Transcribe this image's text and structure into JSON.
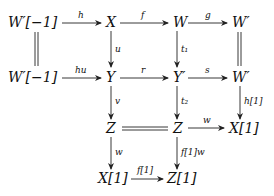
{
  "diagram": {
    "type": "commutative-diagram",
    "nodes": {
      "r1c0": "W′[−1]",
      "r1c1": "X",
      "r1c2": "W",
      "r1c3": "W′",
      "r2c0": "W′[−1]",
      "r2c1": "Y",
      "r2c2": "Y′",
      "r2c3": "W′",
      "r3c1": "Z",
      "r3c2": "Z",
      "r3c3": "X[1]",
      "r4c1": "X[1]",
      "r4c2": "Z[1]"
    },
    "arrows": {
      "h": "h",
      "f": "f",
      "g": "g",
      "hu": "hu",
      "r": "r",
      "s": "s",
      "u": "u",
      "t1": "t₁",
      "v": "v",
      "t2": "t₂",
      "h1": "h[1]",
      "w_horiz": "w",
      "w_vert": "w",
      "f1w": "f[1]w",
      "f1": "f[1]"
    },
    "equalities": [
      "W′[−1] = W′[−1]",
      "W′ = W′",
      "Z = Z"
    ]
  }
}
